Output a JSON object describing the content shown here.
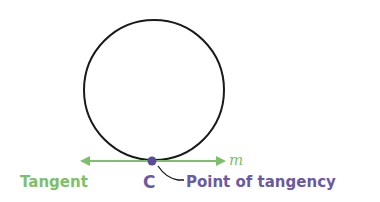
{
  "diagram": {
    "circle": {
      "cx": 154,
      "cy": 90,
      "r": 70,
      "stroke": "#1a1a1a"
    },
    "tangent_line": {
      "label": "m",
      "color": "#7dc06a",
      "y": 161,
      "x1": 82,
      "x2": 224
    },
    "point": {
      "label": "C",
      "cx": 152,
      "cy": 161,
      "color": "#5b4b9a"
    },
    "labels": {
      "tangent": "Tangent",
      "point_of_tangency": "Point of tangency",
      "line_name": "m",
      "point_name": "C"
    },
    "colors": {
      "green": "#7dc06a",
      "purple": "#6b5aa2",
      "black": "#1a1a1a"
    }
  }
}
